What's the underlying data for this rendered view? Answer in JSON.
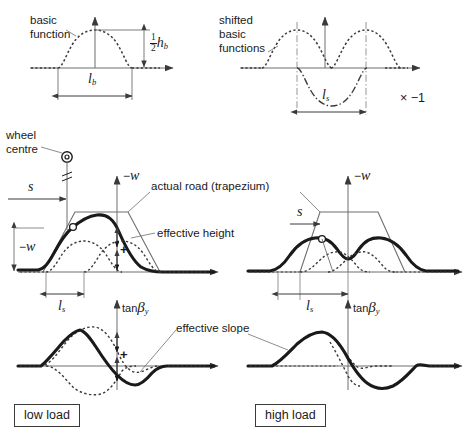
{
  "figure": {
    "panels": [
      {
        "id": "basic-function",
        "label_line1": "basic",
        "label_line2": "function",
        "dim_height": "½ h_b",
        "dim_width": "l_b"
      },
      {
        "id": "shifted-basic-functions",
        "label_line1": "shifted",
        "label_line2": "basic",
        "label_line3": "functions",
        "multiplier": "× −1",
        "dim_width": "l_s"
      },
      {
        "id": "low-load",
        "box_label": "low load",
        "height_axis": "− w",
        "slope_axis": "tan β_y",
        "dim_s": "s",
        "dim_w": "− w",
        "dim_ls": "l_s",
        "plus_marker": "+"
      },
      {
        "id": "high-load",
        "box_label": "high load",
        "height_axis": "− w",
        "slope_axis": "tan β_y",
        "dim_s": "s",
        "dim_ls": "l_s"
      }
    ],
    "callouts": [
      {
        "id": "wheel-centre",
        "line1": "wheel",
        "line2": "centre"
      },
      {
        "id": "actual-road",
        "text": "actual road (trapezium)"
      },
      {
        "id": "effective-height",
        "text": "effective height"
      },
      {
        "id": "effective-slope",
        "text": "effective slope"
      }
    ],
    "symbols": {
      "minus_w": "−w",
      "tan_beta": "tan",
      "beta": "β",
      "beta_sub": "y",
      "l": "l",
      "b_sub": "b",
      "s_sub": "s",
      "h": "h",
      "s": "s",
      "half": "1/2",
      "times_minus_one": "× −1",
      "plus": "+"
    },
    "colors": {
      "ink": "#1a1a1a",
      "thin_line": "#6e6e6e",
      "background": "#ffffff",
      "box_border": "#3a3a3a"
    }
  }
}
